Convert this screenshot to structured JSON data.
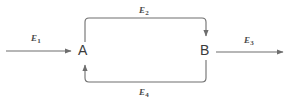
{
  "diagram": {
    "type": "block-flow-feedback-loop",
    "background_color": "#ffffff",
    "line_color": "#6e6e6e",
    "label_color": "#4a4a4a",
    "node_label_color": "#3b3b3b",
    "nodes": [
      {
        "id": "A",
        "label": "A",
        "x": 83,
        "y": 50
      },
      {
        "id": "B",
        "label": "B",
        "x": 205,
        "y": 50
      }
    ],
    "edges": [
      {
        "id": "E1",
        "label": "E",
        "subscript": "1",
        "from": "input",
        "to": "A",
        "direction": "right",
        "arrowhead": true
      },
      {
        "id": "E2",
        "label": "E",
        "subscript": "2",
        "from": "A",
        "to": "B",
        "direction": "top-path",
        "arrowhead": true
      },
      {
        "id": "E3",
        "label": "E",
        "subscript": "3",
        "from": "B",
        "to": "output",
        "direction": "right",
        "arrowhead": true
      },
      {
        "id": "E4",
        "label": "E",
        "subscript": "4",
        "from": "B",
        "to": "A",
        "direction": "bottom-path",
        "arrowhead": true
      }
    ]
  }
}
